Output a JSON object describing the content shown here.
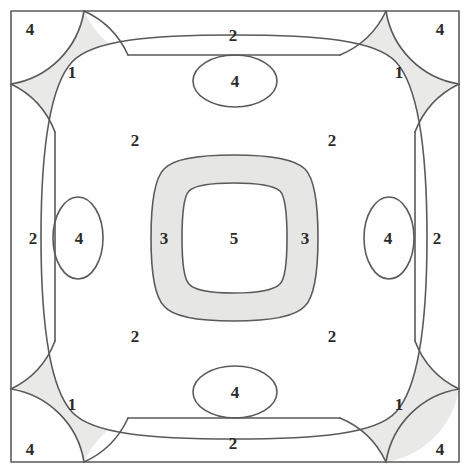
{
  "figure": {
    "background_color": "#fefefe",
    "stroke_color": "#555555",
    "shade_color": "#e8e8e6",
    "frame": {
      "x": 11,
      "y": 11,
      "width": 448,
      "height": 451
    }
  },
  "labels": [
    {
      "text": "4",
      "x": 30,
      "y": 29,
      "region": "corner-top-left"
    },
    {
      "text": "2",
      "x": 233,
      "y": 35,
      "region": "edge-top"
    },
    {
      "text": "4",
      "x": 440,
      "y": 29,
      "region": "corner-top-right"
    },
    {
      "text": "1",
      "x": 72,
      "y": 72,
      "region": "diagonal-top-left"
    },
    {
      "text": "1",
      "x": 399,
      "y": 72,
      "region": "diagonal-top-right"
    },
    {
      "text": "4",
      "x": 235,
      "y": 81,
      "region": "lobe-top"
    },
    {
      "text": "2",
      "x": 135,
      "y": 140,
      "region": "inner-top-left"
    },
    {
      "text": "2",
      "x": 332,
      "y": 140,
      "region": "inner-top-right"
    },
    {
      "text": "2",
      "x": 33,
      "y": 238,
      "region": "edge-left"
    },
    {
      "text": "4",
      "x": 79,
      "y": 238,
      "region": "lobe-left"
    },
    {
      "text": "3",
      "x": 164,
      "y": 238,
      "region": "ring-left"
    },
    {
      "text": "5",
      "x": 234,
      "y": 238,
      "region": "center"
    },
    {
      "text": "3",
      "x": 305,
      "y": 238,
      "region": "ring-right"
    },
    {
      "text": "4",
      "x": 388,
      "y": 238,
      "region": "lobe-right"
    },
    {
      "text": "2",
      "x": 437,
      "y": 238,
      "region": "edge-right"
    },
    {
      "text": "2",
      "x": 135,
      "y": 336,
      "region": "inner-bottom-left"
    },
    {
      "text": "2",
      "x": 332,
      "y": 336,
      "region": "inner-bottom-right"
    },
    {
      "text": "4",
      "x": 235,
      "y": 392,
      "region": "lobe-bottom"
    },
    {
      "text": "1",
      "x": 72,
      "y": 404,
      "region": "diagonal-bottom-left"
    },
    {
      "text": "1",
      "x": 399,
      "y": 404,
      "region": "diagonal-bottom-right"
    },
    {
      "text": "4",
      "x": 30,
      "y": 449,
      "region": "corner-bottom-left"
    },
    {
      "text": "2",
      "x": 233,
      "y": 443,
      "region": "edge-bottom"
    },
    {
      "text": "4",
      "x": 440,
      "y": 449,
      "region": "corner-bottom-right"
    }
  ]
}
